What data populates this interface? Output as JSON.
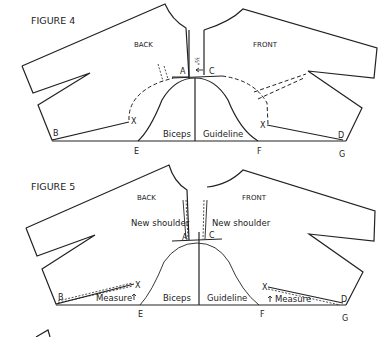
{
  "figure4": {
    "title": "FIGURE 4",
    "back_label": "BACK",
    "front_label": "FRONT",
    "points": {
      "A": "A",
      "C": "C",
      "B": "B",
      "X1": "X",
      "X2": "X",
      "E": "E",
      "F": "F",
      "D": "D",
      "G": "G"
    },
    "biceps_label": "Biceps",
    "guideline_label": "Guideline",
    "fraction_label": "½\""
  },
  "figure5": {
    "title": "FIGURE 5",
    "back_label": "BACK",
    "front_label": "FRONT",
    "new_shoulder_left": "New shoulder",
    "new_shoulder_right": "New shoulder",
    "points": {
      "A": "A",
      "C": "C",
      "B": "B",
      "X1": "X",
      "X2": "X",
      "E": "E",
      "F": "F",
      "D": "D",
      "G": "G"
    },
    "biceps_label": "Biceps",
    "guideline_label": "Guideline",
    "measure_left": "Measure",
    "measure_right": "Measure"
  }
}
